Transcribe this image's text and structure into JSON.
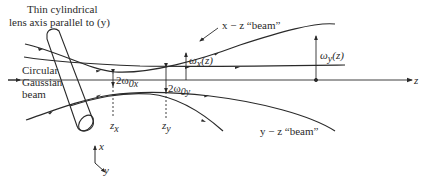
{
  "diagram": {
    "lens_label_line1": "Thin cylindrical",
    "lens_label_line2": "lens axis parallel to (y)",
    "input_label_line1": "Circular",
    "input_label_line2": "Gaussian",
    "input_label_line3": "beam",
    "xz_beam_label": "x − z “beam”",
    "yz_beam_label": "y − z “beam”",
    "wx_label": "ω",
    "wx_sub": "x",
    "wx_arg": "(z)",
    "wy_label": "ω",
    "wy_sub": "y",
    "wy_arg": "(z)",
    "waist_x_label": "2ω",
    "waist_x_sub": "0x",
    "waist_y_label": "2ω",
    "waist_y_sub": "0y",
    "zx_label": "z",
    "zx_sub": "x",
    "zy_label": "z",
    "zy_sub": "y",
    "z_axis_label": "z",
    "axis_x_label": "x",
    "axis_y_label": "y",
    "line_color": "#2a2a2a"
  }
}
